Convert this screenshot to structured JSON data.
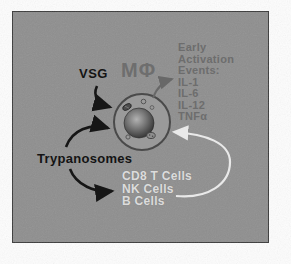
{
  "figure": {
    "macrophage_label": "MΦ",
    "vsg_label": "VSG",
    "trypanosomes_label": "Trypanosomes",
    "early_activation": {
      "lines": [
        "Early",
        "Activation",
        "Events:",
        "IL-1",
        "IL-6",
        "IL-12",
        "TNFα"
      ]
    },
    "responder_cells": {
      "lines": [
        "CD8 T Cells",
        "NK Cells",
        "B Cells"
      ]
    },
    "colors": {
      "panel_background": "#8e8e8e",
      "panel_border": "#3a3a3a",
      "black_label_text": "#141414",
      "gray_label_text": "#6d6d6d",
      "light_cell_text": "#dcdcdc",
      "black_arrow": "#161616",
      "gray_arrow": "#686868",
      "white_arrow": "#e9e9e9",
      "macrophage_membrane": "#4a4a4a",
      "macrophage_cytoplasm": "#9a9a9a",
      "nucleus_dark": "#2e2e2e"
    }
  }
}
